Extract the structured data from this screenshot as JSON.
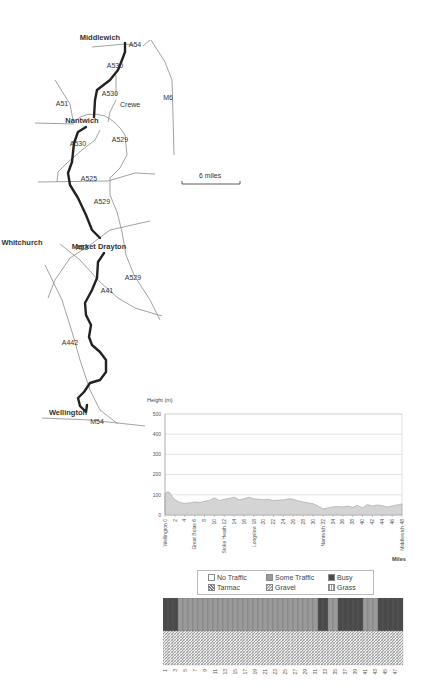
{
  "map": {
    "towns": [
      {
        "name": "Middlewich",
        "x": 100,
        "y": 40
      },
      {
        "name": "Nantwich",
        "x": 82,
        "y": 123
      },
      {
        "name": "Market Drayton",
        "x": 99,
        "y": 249
      },
      {
        "name": "Whitchurch",
        "x": 22,
        "y": 245
      },
      {
        "name": "Wellington",
        "x": 68,
        "y": 415
      }
    ],
    "places": [
      {
        "name": "Crewe",
        "x": 120,
        "y": 107
      }
    ],
    "roads": [
      {
        "name": "A54",
        "x": 135,
        "y": 47
      },
      {
        "name": "A530",
        "x": 115,
        "y": 68
      },
      {
        "name": "A530",
        "x": 110,
        "y": 96
      },
      {
        "name": "A51",
        "x": 62,
        "y": 106
      },
      {
        "name": "M6",
        "x": 168,
        "y": 100
      },
      {
        "name": "A530",
        "x": 78,
        "y": 146
      },
      {
        "name": "A529",
        "x": 120,
        "y": 142
      },
      {
        "name": "A525",
        "x": 89,
        "y": 181
      },
      {
        "name": "A529",
        "x": 102,
        "y": 204
      },
      {
        "name": "A53",
        "x": 82,
        "y": 250
      },
      {
        "name": "A529",
        "x": 133,
        "y": 280
      },
      {
        "name": "A41",
        "x": 107,
        "y": 293
      },
      {
        "name": "A442",
        "x": 70,
        "y": 345
      },
      {
        "name": "M54",
        "x": 97,
        "y": 424
      }
    ],
    "scale": {
      "label": "6  miles"
    }
  },
  "chart_data": [
    {
      "type": "area",
      "title": "",
      "ylabel": "Height (m)",
      "xlabel": "Miles",
      "ylim": [
        0,
        500
      ],
      "yticks": [
        0,
        100,
        200,
        300,
        400,
        500
      ],
      "grid": true,
      "x_tick_labels": [
        "Wellington 0",
        "2",
        "4",
        "Great Bolas 6",
        "8",
        "10",
        "Stoke Heath 12",
        "14",
        "16",
        "Longslow 18",
        "20",
        "22",
        "24",
        "26",
        "28",
        "30",
        "Nantwich 32",
        "34",
        "36",
        "38",
        "40",
        "42",
        "44",
        "46",
        "Middlewich 48"
      ],
      "x": [
        0,
        0.5,
        1,
        1.5,
        2,
        3,
        4,
        5,
        6,
        7,
        8,
        9,
        10,
        11,
        12,
        13,
        14,
        15,
        16,
        17,
        18,
        19,
        20,
        21,
        22,
        23,
        24,
        25,
        26,
        27,
        28,
        29,
        30,
        31,
        32,
        33,
        34,
        35,
        36,
        37,
        38,
        39,
        40,
        41,
        42,
        43,
        44,
        45,
        46,
        47,
        48
      ],
      "values": [
        105,
        115,
        110,
        90,
        75,
        62,
        58,
        60,
        65,
        62,
        68,
        72,
        85,
        72,
        78,
        82,
        88,
        75,
        80,
        88,
        80,
        78,
        75,
        77,
        72,
        74,
        75,
        80,
        78,
        70,
        65,
        60,
        56,
        45,
        30,
        35,
        40,
        42,
        40,
        44,
        38,
        48,
        35,
        52,
        44,
        50,
        46,
        40,
        45,
        50,
        55
      ]
    },
    {
      "type": "heatmap",
      "title": "Traffic and surface by mile",
      "legend": [
        {
          "label": "No Traffic",
          "pattern": "none"
        },
        {
          "label": "Some Traffic",
          "pattern": "some"
        },
        {
          "label": "Busy",
          "pattern": "busy"
        },
        {
          "label": "Tarmac",
          "pattern": "tarmac"
        },
        {
          "label": "Gravel",
          "pattern": "gravel"
        },
        {
          "label": "Grass",
          "pattern": "grass"
        }
      ],
      "x_tick_labels": [
        "1",
        "3",
        "5",
        "7",
        "9",
        "11",
        "13",
        "15",
        "17",
        "19",
        "21",
        "23",
        "25",
        "27",
        "29",
        "31",
        "33",
        "35",
        "37",
        "39",
        "41",
        "43",
        "45",
        "47"
      ],
      "miles": [
        1,
        2,
        3,
        4,
        5,
        6,
        7,
        8,
        9,
        10,
        11,
        12,
        13,
        14,
        15,
        16,
        17,
        18,
        19,
        20,
        21,
        22,
        23,
        24,
        25,
        26,
        27,
        28,
        29,
        30,
        31,
        32,
        33,
        34,
        35,
        36,
        37,
        38,
        39,
        40,
        41,
        42,
        43,
        44,
        45,
        46,
        47,
        48
      ],
      "traffic": [
        "busy",
        "busy",
        "busy",
        "some",
        "some",
        "some",
        "some",
        "some",
        "some",
        "some",
        "some",
        "some",
        "some",
        "some",
        "some",
        "some",
        "some",
        "some",
        "some",
        "some",
        "some",
        "some",
        "some",
        "some",
        "some",
        "some",
        "some",
        "some",
        "some",
        "some",
        "some",
        "busy",
        "busy",
        "some",
        "some",
        "busy",
        "busy",
        "busy",
        "busy",
        "busy",
        "some",
        "some",
        "some",
        "busy",
        "busy",
        "busy",
        "busy",
        "busy"
      ],
      "surface": [
        "tarmac",
        "tarmac",
        "tarmac",
        "tarmac",
        "tarmac",
        "tarmac",
        "tarmac",
        "tarmac",
        "tarmac",
        "tarmac",
        "tarmac",
        "tarmac",
        "tarmac",
        "tarmac",
        "tarmac",
        "tarmac",
        "tarmac",
        "tarmac",
        "tarmac",
        "tarmac",
        "tarmac",
        "tarmac",
        "tarmac",
        "tarmac",
        "tarmac",
        "tarmac",
        "tarmac",
        "tarmac",
        "tarmac",
        "tarmac",
        "tarmac",
        "tarmac",
        "tarmac",
        "tarmac",
        "tarmac",
        "tarmac",
        "tarmac",
        "tarmac",
        "tarmac",
        "tarmac",
        "tarmac",
        "tarmac",
        "tarmac",
        "tarmac",
        "tarmac",
        "tarmac",
        "tarmac",
        "tarmac"
      ]
    }
  ],
  "legend": {
    "no_traffic": "No Traffic",
    "some_traffic": "Some Traffic",
    "busy": "Busy",
    "tarmac": "Tarmac",
    "gravel": "Gravel",
    "grass": "Grass"
  },
  "chart": {
    "ylabel": "Height (m)",
    "xlabel": "Miles"
  },
  "colors": {
    "route": "#222222",
    "road": "#888888",
    "area_fill": "#d4d4d4",
    "area_line": "#a0a0a0",
    "grid": "#cfcfcf",
    "busy": "#4a4a4a",
    "some": "#9a9a9a",
    "none": "#ffffff"
  }
}
